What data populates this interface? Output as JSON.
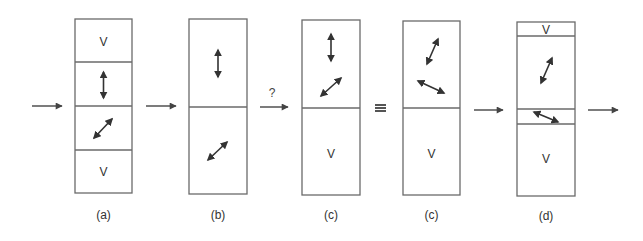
{
  "diagram": {
    "flow_arrow_label": "?",
    "equivalence_symbol": "≡",
    "void_label": "V",
    "panels": [
      {
        "label": "(a)",
        "layers": [
          {
            "content": "V"
          },
          {
            "content": "vertical-double-arrow"
          },
          {
            "content": "diagonal-double-arrow"
          },
          {
            "content": "V"
          }
        ]
      },
      {
        "label": "(b)",
        "layers": [
          {
            "content": "vertical-double-arrow"
          },
          {
            "content": "diagonal-double-arrow"
          }
        ]
      },
      {
        "label": "(c)",
        "layers": [
          {
            "content": "vertical-double-arrow + diagonal-double-arrow"
          },
          {
            "content": "V"
          }
        ]
      },
      {
        "label": "(c)",
        "layers": [
          {
            "content": "steep-tilted-double-arrow + shallow-tilted-double-arrow"
          },
          {
            "content": "V"
          }
        ]
      },
      {
        "label": "(d)",
        "layers": [
          {
            "content": "V"
          },
          {
            "content": "steep-tilted-double-arrow"
          },
          {
            "content": "shallow-tilted-double-arrow"
          },
          {
            "content": "V"
          }
        ]
      }
    ]
  }
}
